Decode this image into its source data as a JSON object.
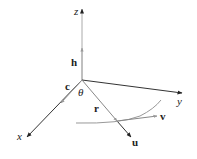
{
  "diagram": {
    "axes": {
      "z": "z",
      "y": "y",
      "x": "x"
    },
    "vectors": {
      "h": "h",
      "c": "c",
      "r": "r",
      "u": "u",
      "v": "v"
    },
    "angle": "θ",
    "colors": {
      "axis": "#333333",
      "vector_gray": "#888888",
      "curve": "#999999",
      "text": "#222222"
    }
  }
}
